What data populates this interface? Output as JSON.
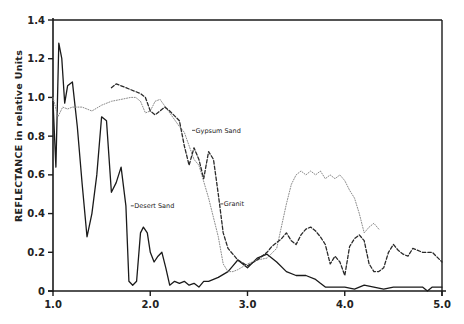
{
  "chart_data": {
    "type": "line",
    "title": "",
    "xlabel": "",
    "ylabel": "REFLECTANCE in relative Units",
    "xlim": [
      1.0,
      5.0
    ],
    "ylim": [
      0,
      1.4
    ],
    "grid": false,
    "legend": "none (inline curve labels)",
    "x_ticks": [
      "1.0",
      "2.0",
      "3.0",
      "4.0",
      "5.0"
    ],
    "y_ticks": [
      "0",
      "0.2",
      "0.4",
      "0.6",
      "0.8",
      "1.0",
      "1.2",
      "1.4"
    ],
    "series": [
      {
        "name": "Desert Sand",
        "style": "solid",
        "color": "#1a1a1a",
        "x": [
          1.0,
          1.03,
          1.06,
          1.09,
          1.12,
          1.15,
          1.2,
          1.25,
          1.3,
          1.35,
          1.4,
          1.45,
          1.5,
          1.55,
          1.6,
          1.65,
          1.7,
          1.75,
          1.78,
          1.82,
          1.86,
          1.9,
          1.93,
          1.97,
          2.0,
          2.04,
          2.08,
          2.12,
          2.16,
          2.2,
          2.25,
          2.3,
          2.35,
          2.4,
          2.45,
          2.5,
          2.55,
          2.6,
          2.7,
          2.8,
          2.85,
          2.9,
          3.0,
          3.1,
          3.2,
          3.3,
          3.4,
          3.5,
          3.6,
          3.7,
          3.75,
          3.8,
          3.9,
          4.0,
          4.1,
          4.2,
          4.3,
          4.4,
          4.5,
          4.6,
          4.7,
          4.8,
          4.85,
          4.9,
          5.0
        ],
        "y": [
          0.98,
          0.64,
          1.28,
          1.2,
          0.97,
          1.06,
          1.08,
          0.85,
          0.55,
          0.28,
          0.4,
          0.6,
          0.9,
          0.88,
          0.51,
          0.56,
          0.64,
          0.44,
          0.05,
          0.03,
          0.05,
          0.3,
          0.33,
          0.3,
          0.2,
          0.15,
          0.18,
          0.2,
          0.12,
          0.03,
          0.05,
          0.04,
          0.05,
          0.03,
          0.04,
          0.02,
          0.05,
          0.05,
          0.07,
          0.1,
          0.13,
          0.16,
          0.12,
          0.17,
          0.19,
          0.15,
          0.1,
          0.08,
          0.08,
          0.06,
          0.04,
          0.02,
          0.02,
          0.02,
          0.01,
          0.03,
          0.02,
          0.01,
          0.02,
          0.02,
          0.02,
          0.02,
          0.0,
          0.02,
          0.02
        ],
        "annotation": {
          "text": "Desert Sand",
          "x": 1.8,
          "y": 0.44
        }
      },
      {
        "name": "Gypsum Sand",
        "style": "dotted",
        "color": "#8a8a8a",
        "x": [
          1.0,
          1.05,
          1.1,
          1.15,
          1.2,
          1.3,
          1.4,
          1.5,
          1.6,
          1.7,
          1.8,
          1.85,
          1.9,
          1.95,
          2.0,
          2.05,
          2.1,
          2.2,
          2.3,
          2.35,
          2.4,
          2.45,
          2.5,
          2.6,
          2.7,
          2.75,
          2.8,
          2.85,
          2.9,
          3.0,
          3.1,
          3.2,
          3.3,
          3.4,
          3.45,
          3.5,
          3.55,
          3.6,
          3.65,
          3.7,
          3.75,
          3.8,
          3.85,
          3.9,
          3.95,
          4.0,
          4.05,
          4.1,
          4.15,
          4.2,
          4.25,
          4.3,
          4.35
        ],
        "y": [
          1.0,
          0.9,
          0.95,
          0.94,
          0.95,
          0.95,
          0.93,
          0.96,
          0.98,
          0.99,
          1.0,
          1.0,
          0.98,
          0.92,
          0.93,
          0.98,
          0.99,
          0.92,
          0.85,
          0.82,
          0.75,
          0.68,
          0.65,
          0.48,
          0.28,
          0.14,
          0.1,
          0.1,
          0.11,
          0.14,
          0.16,
          0.17,
          0.22,
          0.45,
          0.55,
          0.6,
          0.62,
          0.6,
          0.62,
          0.6,
          0.62,
          0.58,
          0.6,
          0.58,
          0.6,
          0.57,
          0.52,
          0.48,
          0.4,
          0.3,
          0.33,
          0.35,
          0.32
        ],
        "annotation": {
          "text": "Gypsum Sand",
          "x": 2.43,
          "y": 0.83
        }
      },
      {
        "name": "Granit",
        "style": "dashed",
        "color": "#2a2a2a",
        "x": [
          1.6,
          1.65,
          1.7,
          1.8,
          1.85,
          1.9,
          1.95,
          2.0,
          2.05,
          2.1,
          2.15,
          2.2,
          2.3,
          2.35,
          2.4,
          2.45,
          2.5,
          2.55,
          2.6,
          2.65,
          2.7,
          2.75,
          2.8,
          2.9,
          3.0,
          3.1,
          3.2,
          3.25,
          3.3,
          3.35,
          3.4,
          3.45,
          3.5,
          3.55,
          3.6,
          3.65,
          3.7,
          3.75,
          3.8,
          3.85,
          3.9,
          3.95,
          4.0,
          4.05,
          4.1,
          4.15,
          4.2,
          4.25,
          4.3,
          4.35,
          4.4,
          4.45,
          4.5,
          4.55,
          4.6,
          4.65,
          4.7,
          4.8,
          4.9,
          5.0
        ],
        "y": [
          1.05,
          1.07,
          1.06,
          1.04,
          1.03,
          1.02,
          1.0,
          0.93,
          0.91,
          0.93,
          0.95,
          0.93,
          0.88,
          0.75,
          0.65,
          0.74,
          0.68,
          0.58,
          0.72,
          0.68,
          0.5,
          0.3,
          0.22,
          0.16,
          0.13,
          0.16,
          0.2,
          0.23,
          0.25,
          0.27,
          0.3,
          0.26,
          0.24,
          0.29,
          0.32,
          0.33,
          0.31,
          0.28,
          0.24,
          0.14,
          0.18,
          0.15,
          0.08,
          0.23,
          0.27,
          0.29,
          0.26,
          0.14,
          0.1,
          0.1,
          0.12,
          0.2,
          0.24,
          0.21,
          0.19,
          0.18,
          0.22,
          0.2,
          0.2,
          0.15
        ],
        "annotation": {
          "text": "Granit",
          "x": 2.72,
          "y": 0.45
        }
      }
    ]
  }
}
